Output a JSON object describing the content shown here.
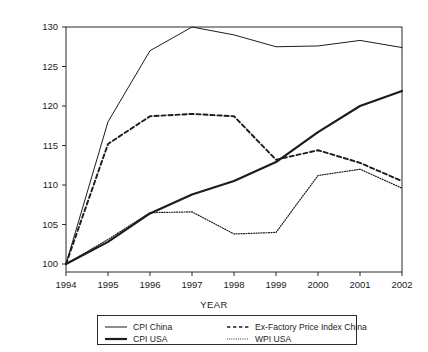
{
  "chart_data": {
    "type": "line",
    "title": "",
    "xlabel": "YEAR",
    "ylabel": "",
    "x": [
      1994,
      1995,
      1996,
      1997,
      1998,
      1999,
      2000,
      2001,
      2002
    ],
    "categories": [
      "1994",
      "1995",
      "1996",
      "1997",
      "1998",
      "1999",
      "2000",
      "2001",
      "2002"
    ],
    "xlim": [
      1994,
      2002
    ],
    "ylim": [
      100,
      130
    ],
    "yticks": [
      100,
      105,
      110,
      115,
      120,
      125,
      130
    ],
    "xticks": [
      "1994",
      "1995",
      "1996",
      "1997",
      "1998",
      "1999",
      "2000",
      "2001",
      "2002"
    ],
    "grid": false,
    "legend_position": "below-axis",
    "series": [
      {
        "name": "CPI China",
        "style": "thin-solid",
        "values": [
          100.0,
          118.0,
          127.0,
          130.0,
          129.0,
          127.5,
          127.6,
          128.3,
          127.4
        ]
      },
      {
        "name": "CPI USA",
        "style": "thick-solid",
        "values": [
          100.0,
          102.8,
          106.4,
          108.8,
          110.5,
          112.9,
          116.7,
          120.0,
          121.9
        ]
      },
      {
        "name": "Ex-Factory Price Index China",
        "style": "dashed",
        "values": [
          100.0,
          115.2,
          118.7,
          119.0,
          118.7,
          113.2,
          114.4,
          112.8,
          110.5
        ]
      },
      {
        "name": "WPI USA",
        "style": "dotted",
        "values": [
          100.0,
          103.1,
          106.5,
          106.6,
          103.8,
          104.0,
          111.2,
          112.0,
          109.6
        ]
      }
    ]
  },
  "axis": {
    "x_title": "YEAR",
    "y_tick_labels": [
      "130",
      "125",
      "120",
      "115",
      "110",
      "105",
      "100"
    ],
    "x_tick_labels": [
      "1994",
      "1995",
      "1996",
      "1997",
      "1998",
      "1999",
      "2000",
      "2001",
      "2002"
    ]
  },
  "legend": {
    "entries": [
      {
        "label": "CPI China",
        "style": "thin-solid"
      },
      {
        "label": "CPI USA",
        "style": "thick-solid"
      },
      {
        "label": "Ex-Factory Price Index China",
        "style": "dashed"
      },
      {
        "label": "WPI USA",
        "style": "dotted"
      }
    ]
  },
  "colors": {
    "line": "#1c1c1c",
    "frame": "#2b2b2b",
    "background": "#ffffff"
  }
}
